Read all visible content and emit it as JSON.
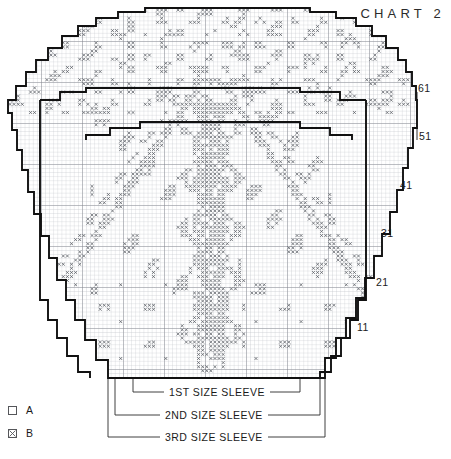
{
  "title": "CHART 2",
  "row_labels": [
    {
      "text": "61",
      "x": 418,
      "y": 88
    },
    {
      "text": "51",
      "x": 419,
      "y": 135
    },
    {
      "text": "41",
      "x": 400,
      "y": 184
    },
    {
      "text": "31",
      "x": 381,
      "y": 232
    },
    {
      "text": "21",
      "x": 376,
      "y": 281
    },
    {
      "text": "11",
      "x": 357,
      "y": 326
    }
  ],
  "brackets": [
    {
      "label": "1ST SIZE SLEEVE",
      "left": 133,
      "right": 300,
      "y": 392,
      "label_x": 216,
      "label_y": 392
    },
    {
      "label": "2ND SIZE SLEEVE",
      "left": 115,
      "right": 320,
      "y": 415,
      "label_x": 216,
      "label_y": 415
    },
    {
      "label": "3RD SIZE SLEEVE",
      "left": 108,
      "right": 325,
      "y": 437,
      "label_x": 216,
      "label_y": 437
    }
  ],
  "legend": {
    "items": [
      {
        "key": "A",
        "label": "A",
        "symbol": "empty-square",
        "meaning": "A"
      },
      {
        "key": "B",
        "label": "B",
        "symbol": "crossed-square",
        "meaning": "B"
      }
    ]
  },
  "colors": {
    "grid_fine": "#b9bcc2",
    "grid_major": "#7d8088",
    "outline": "#111111",
    "symbol": "#5a5d64",
    "text": "#1a1a1a",
    "background": "#ffffff"
  },
  "chart_data": {
    "type": "heatmap",
    "title": "CHART 2",
    "xlabel": "",
    "ylabel": "",
    "cell_px": 4.1,
    "grid_origin": [
      8,
      8
    ],
    "grid_cols": 98,
    "grid_rows": 89,
    "major_gridline_every": 10,
    "row_tick_labels": [
      "11",
      "21",
      "31",
      "41",
      "51",
      "61"
    ],
    "legend": [
      {
        "symbol": "blank",
        "name": "A"
      },
      {
        "symbol": "cross",
        "name": "B"
      }
    ],
    "size_brackets": [
      "1ST SIZE SLEEVE",
      "2ND SIZE SLEEVE",
      "3RD SIZE SLEEVE"
    ],
    "outlines": [
      {
        "name": "3RD SIZE SLEEVE",
        "points": [
          [
            8,
            110
          ],
          [
            8,
            113
          ],
          [
            12,
            113
          ],
          [
            12,
            130
          ],
          [
            17,
            130
          ],
          [
            17,
            150
          ],
          [
            22,
            150
          ],
          [
            22,
            170
          ],
          [
            28,
            170
          ],
          [
            28,
            192
          ],
          [
            34,
            192
          ],
          [
            34,
            214
          ],
          [
            41,
            214
          ],
          [
            41,
            236
          ],
          [
            49,
            236
          ],
          [
            49,
            258
          ],
          [
            57,
            258
          ],
          [
            57,
            280
          ],
          [
            66,
            280
          ],
          [
            66,
            300
          ],
          [
            75,
            300
          ],
          [
            75,
            320
          ],
          [
            85,
            320
          ],
          [
            85,
            340
          ],
          [
            96,
            340
          ],
          [
            96,
            360
          ],
          [
            108,
            360
          ],
          [
            108,
            378
          ],
          [
            325,
            378
          ],
          [
            325,
            358
          ],
          [
            336,
            358
          ],
          [
            336,
            338
          ],
          [
            346,
            338
          ],
          [
            346,
            318
          ],
          [
            356,
            318
          ],
          [
            356,
            298
          ],
          [
            365,
            298
          ],
          [
            365,
            278
          ],
          [
            374,
            278
          ],
          [
            374,
            256
          ],
          [
            382,
            256
          ],
          [
            382,
            234
          ],
          [
            390,
            234
          ],
          [
            390,
            212
          ],
          [
            397,
            212
          ],
          [
            397,
            190
          ],
          [
            403,
            190
          ],
          [
            403,
            168
          ],
          [
            408,
            168
          ],
          [
            408,
            148
          ],
          [
            413,
            148
          ],
          [
            413,
            128
          ],
          [
            417,
            128
          ],
          [
            417,
            110
          ]
        ]
      },
      {
        "name": "2ND SIZE SLEEVE",
        "points": [
          [
            40,
            100
          ],
          [
            40,
            300
          ],
          [
            48,
            300
          ],
          [
            48,
            320
          ],
          [
            57,
            320
          ],
          [
            57,
            338
          ],
          [
            67,
            338
          ],
          [
            67,
            356
          ],
          [
            78,
            356
          ],
          [
            78,
            372
          ],
          [
            90,
            372
          ],
          [
            90,
            378
          ],
          [
            320,
            378
          ],
          [
            320,
            372
          ],
          [
            331,
            372
          ],
          [
            331,
            356
          ],
          [
            341,
            356
          ],
          [
            341,
            338
          ],
          [
            350,
            338
          ],
          [
            350,
            320
          ],
          [
            358,
            320
          ],
          [
            358,
            300
          ],
          [
            366,
            300
          ],
          [
            366,
            100
          ]
        ]
      },
      {
        "name": "1ST SIZE SLEEVE",
        "points": [
          [
            88,
            90
          ],
          [
            88,
            92
          ],
          [
            300,
            92
          ],
          [
            300,
            90
          ]
        ]
      }
    ],
    "outer_boundary": {
      "name": "chart-outer-stepped-boundary",
      "points": [
        [
          8,
          110
        ],
        [
          8,
          100
        ],
        [
          16,
          100
        ],
        [
          16,
          86
        ],
        [
          26,
          86
        ],
        [
          26,
          72
        ],
        [
          36,
          72
        ],
        [
          36,
          60
        ],
        [
          48,
          60
        ],
        [
          48,
          48
        ],
        [
          62,
          48
        ],
        [
          62,
          36
        ],
        [
          78,
          36
        ],
        [
          78,
          26
        ],
        [
          96,
          26
        ],
        [
          96,
          18
        ],
        [
          118,
          18
        ],
        [
          118,
          12
        ],
        [
          145,
          12
        ],
        [
          145,
          8
        ],
        [
          310,
          8
        ],
        [
          310,
          12
        ],
        [
          336,
          12
        ],
        [
          336,
          18
        ],
        [
          356,
          18
        ],
        [
          356,
          26
        ],
        [
          372,
          26
        ],
        [
          372,
          36
        ],
        [
          386,
          36
        ],
        [
          386,
          48
        ],
        [
          398,
          48
        ],
        [
          398,
          60
        ],
        [
          406,
          60
        ],
        [
          406,
          72
        ],
        [
          412,
          72
        ],
        [
          412,
          86
        ],
        [
          416,
          86
        ],
        [
          416,
          100
        ],
        [
          417,
          100
        ],
        [
          417,
          110
        ]
      ]
    },
    "pattern_motifs": [
      {
        "name": "central-floral-stem",
        "approx_center_col": 45,
        "approx_center_row": 55
      },
      {
        "name": "diagonal-vine-left",
        "approx_center_col": 22,
        "approx_center_row": 40
      },
      {
        "name": "diagonal-vine-right",
        "approx_center_col": 70,
        "approx_center_row": 40
      },
      {
        "name": "scattered-leaf-sprigs",
        "approx_center_col": 55,
        "approx_center_row": 20
      }
    ],
    "drop_lines_x": [
      108,
      115,
      133,
      300,
      320,
      325
    ]
  }
}
